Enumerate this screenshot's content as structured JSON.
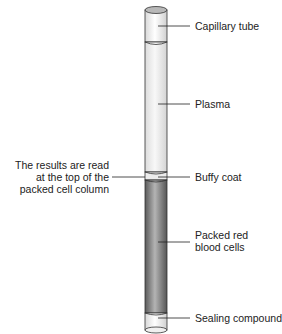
{
  "diagram": {
    "labels": {
      "capillary_tube": "Capillary tube",
      "plasma": "Plasma",
      "buffy_coat": "Buffy coat",
      "packed_red_line1": "Packed red",
      "packed_red_line2": "blood cells",
      "sealing_compound": "Sealing compound",
      "results_line1": "The results are read",
      "results_line2": "at the top of the",
      "results_line3": "packed cell column"
    },
    "colors": {
      "red_cells": "#8a8a8a",
      "plasma": "#f2f2f2",
      "outline": "#333333"
    }
  }
}
